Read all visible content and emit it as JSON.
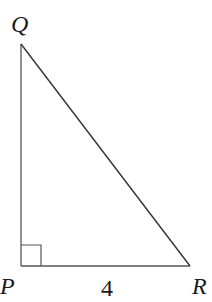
{
  "figure": {
    "type": "right triangle",
    "vertices": {
      "Q": {
        "label": "Q",
        "x": 21,
        "y": 42
      },
      "P": {
        "label": "P",
        "x": 21,
        "y": 266
      },
      "R": {
        "label": "R",
        "x": 190,
        "y": 266
      }
    },
    "right_angle_at": "P",
    "side_labels": {
      "PR": "4"
    },
    "colors": {
      "line": "#333333",
      "text": "#1a1a1a",
      "background": "#ffffff"
    }
  }
}
